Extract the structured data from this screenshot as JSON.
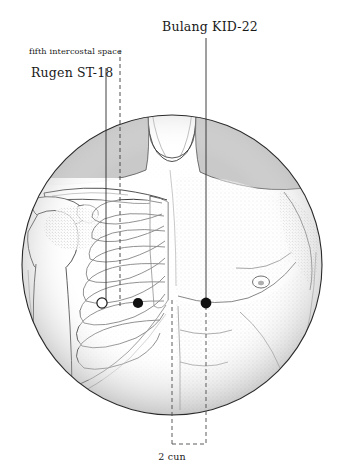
{
  "figure": {
    "title_alt": "Anterior thorax acupoint location diagram",
    "background_color": "#ffffff",
    "ink_color": "#1a1a1a",
    "shade_color": "#c9c9c9",
    "stipple_color": "#8a8a8a"
  },
  "annotations": {
    "kid22": {
      "label": "Bulang KID-22",
      "point_name": "Bulang",
      "point_code": "KID-22",
      "marker": "filled-circle",
      "marker_x": 206,
      "marker_y": 303,
      "leader_x": 206,
      "leader_top_y": 38,
      "leader_bottom_y": 300
    },
    "st18": {
      "label": "Rugen ST-18",
      "point_name": "Rugen",
      "point_code": "ST-18",
      "marker": "open-circle",
      "marker_x": 102,
      "marker_y": 303,
      "leader_x": 106,
      "leader_top_y": 68,
      "leader_bottom_y": 300
    },
    "intercostal": {
      "label": "fifth intercostal space",
      "line_style": "dashed",
      "leader_x": 120,
      "leader_top_y": 52,
      "leader_bottom_y": 306
    },
    "measure": {
      "label": "2 cun",
      "value": 2,
      "unit": "cun",
      "left_x": 172,
      "right_x": 206,
      "bracket_bottom_y": 444,
      "bracket_top_y": 300
    }
  },
  "extra_markers": [
    {
      "name": "second-point-marker",
      "marker": "filled-circle",
      "x": 138,
      "y": 303
    },
    {
      "name": "nipple-marker",
      "marker": "open-circle",
      "x": 261,
      "y": 282
    }
  ]
}
